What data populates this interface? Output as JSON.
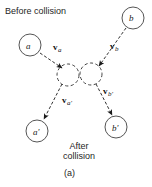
{
  "figure": {
    "index_label": "(a)",
    "caption_before": "Before collision",
    "caption_after_line1": "After",
    "caption_after_line2": "collision",
    "stroke_color": "#1a1a1a",
    "background_color": "#ffffff"
  },
  "bodies": {
    "incoming_a": {
      "label": "a",
      "cx": 30,
      "cy": 45,
      "r": 11
    },
    "incoming_b": {
      "label": "b",
      "cx": 133,
      "cy": 18,
      "r": 11
    },
    "outgoing_a": {
      "label": "a'",
      "cx": 37,
      "cy": 131,
      "r": 11
    },
    "outgoing_b": {
      "label": "b'",
      "cx": 116,
      "cy": 127,
      "r": 11
    }
  },
  "collision": {
    "left_ghost": {
      "cx": 68,
      "cy": 75,
      "r": 11
    },
    "right_ghost": {
      "cx": 91,
      "cy": 74,
      "r": 11
    }
  },
  "vectors": {
    "v_a": {
      "symbol": "v",
      "subscript": "a",
      "from": [
        40,
        53
      ],
      "to": [
        62,
        68
      ]
    },
    "v_b": {
      "symbol": "v",
      "subscript": "b",
      "from": [
        126,
        28
      ],
      "to": [
        99,
        66
      ]
    },
    "v_ap": {
      "symbol": "v",
      "subscript": "a'",
      "from": [
        62,
        84
      ],
      "to": [
        43,
        120
      ]
    },
    "v_bp": {
      "symbol": "v",
      "subscript": "b'",
      "from": [
        96,
        84
      ],
      "to": [
        112,
        116
      ]
    }
  }
}
